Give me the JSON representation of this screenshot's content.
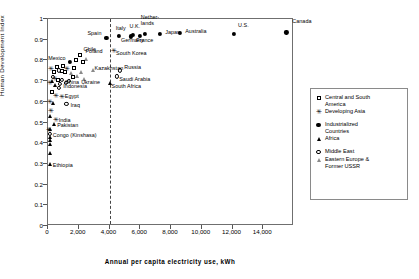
{
  "chart_data": {
    "type": "scatter",
    "title": "",
    "xlabel": "Annual per capita electricity use, kWh",
    "ylabel": "Human Development Index",
    "xlim": [
      0,
      16000
    ],
    "ylim": [
      0,
      1
    ],
    "xticks": [
      "0",
      "2,000",
      "4,000",
      "6,000",
      "8,000",
      "10,000",
      "12,000",
      "14,000"
    ],
    "xtick_values": [
      0,
      2000,
      4000,
      6000,
      8000,
      10000,
      12000,
      14000
    ],
    "yticks": [
      "0",
      "0.1",
      "0.2",
      "0.3",
      "0.4",
      "0.5",
      "0.6",
      "0.7",
      "0.8",
      "0.9",
      "1"
    ],
    "ytick_values": [
      0,
      0.1,
      0.2,
      0.3,
      0.4,
      0.5,
      0.6,
      0.7,
      0.8,
      0.9,
      1
    ],
    "grid": false,
    "threshold_line_x": 4000,
    "legend_position": "right",
    "legend": [
      {
        "label": "Central and South\nAmerica",
        "marker": "open-square"
      },
      {
        "label": "Developing Asia",
        "marker": "plus"
      },
      {
        "label": "Industrialized\nCountries",
        "marker": "filled-circle"
      },
      {
        "label": "Africa",
        "marker": "filled-triangle"
      },
      {
        "label": "Middle East",
        "marker": "open-circle"
      },
      {
        "label": "Eastern Europe &\nFormer USSR",
        "marker": "open-triangle"
      }
    ],
    "points": [
      {
        "name": "Canada",
        "x": 15500,
        "y": 0.935,
        "marker": "filled-circle",
        "label": "Canada",
        "lx": 6,
        "ly": -11
      },
      {
        "name": "U.S.",
        "x": 12100,
        "y": 0.928,
        "marker": "filled-circle",
        "label": "U.S.",
        "lx": 4,
        "ly": -9
      },
      {
        "name": "Australia",
        "x": 8600,
        "y": 0.932,
        "marker": "filled-circle",
        "label": "Australia",
        "lx": 5,
        "ly": -2
      },
      {
        "name": "Japan",
        "x": 7300,
        "y": 0.929,
        "marker": "filled-circle",
        "label": "Japan",
        "lx": 5,
        "ly": -2
      },
      {
        "name": "Netherlands",
        "x": 6300,
        "y": 0.927,
        "marker": "filled-circle",
        "label": "Nether-\nlands",
        "lx": -4,
        "ly": -17
      },
      {
        "name": "France",
        "x": 6000,
        "y": 0.918,
        "marker": "filled-circle",
        "label": "France",
        "lx": -4,
        "ly": 4
      },
      {
        "name": "U.K.",
        "x": 5500,
        "y": 0.923,
        "marker": "filled-circle",
        "label": "U.K.",
        "lx": -3,
        "ly": -9
      },
      {
        "name": "Germany",
        "x": 5400,
        "y": 0.916,
        "marker": "filled-circle",
        "label": "Germany",
        "lx": -10,
        "ly": 4
      },
      {
        "name": "Italy",
        "x": 4600,
        "y": 0.918,
        "marker": "filled-circle",
        "label": "Italy",
        "lx": -3,
        "ly": -8
      },
      {
        "name": "Spain",
        "x": 3800,
        "y": 0.907,
        "marker": "filled-circle",
        "label": "Spain",
        "lx": -19,
        "ly": -5
      },
      {
        "name": "South Korea",
        "x": 4300,
        "y": 0.845,
        "marker": "plus",
        "label": "South Korea",
        "lx": 2,
        "ly": 2
      },
      {
        "name": "Chile",
        "x": 2050,
        "y": 0.828,
        "marker": "open-square",
        "label": "Chile",
        "lx": 4,
        "ly": -6
      },
      {
        "name": "Poland",
        "x": 2500,
        "y": 0.805,
        "marker": "open-triangle",
        "label": "Poland",
        "lx": -1,
        "ly": -8
      },
      {
        "name": "Mexico",
        "x": 1450,
        "y": 0.792,
        "marker": "filled-circle",
        "label": "Mexico",
        "lx": -22,
        "ly": -4
      },
      {
        "name": "Kazakhstan",
        "x": 2900,
        "y": 0.755,
        "marker": "open-triangle",
        "label": "Kazakhstan",
        "lx": 2,
        "ly": -2
      },
      {
        "name": "Russia",
        "x": 4700,
        "y": 0.752,
        "marker": "open-circle",
        "label": "Russia",
        "lx": 4,
        "ly": -3
      },
      {
        "name": "Saudi Arabia",
        "x": 4500,
        "y": 0.723,
        "marker": "open-circle",
        "label": "Saudi Arabia",
        "lx": 2,
        "ly": 3
      },
      {
        "name": "Ukraine",
        "x": 2350,
        "y": 0.712,
        "marker": "open-triangle",
        "label": "Ukraine",
        "lx": -3,
        "ly": 3
      },
      {
        "name": "South Africa",
        "x": 4000,
        "y": 0.693,
        "marker": "filled-triangle",
        "label": "South Africa",
        "lx": 2,
        "ly": 3
      },
      {
        "name": "China",
        "x": 900,
        "y": 0.706,
        "marker": "open-circle",
        "label": "China",
        "lx": 3,
        "ly": 2
      },
      {
        "name": "Indonesia",
        "x": 800,
        "y": 0.688,
        "marker": "open-circle",
        "label": "Indonesia",
        "lx": 3,
        "ly": 2
      },
      {
        "name": "Egypt",
        "x": 900,
        "y": 0.622,
        "marker": "plus",
        "label": "Egypt",
        "lx": 3,
        "ly": -1
      },
      {
        "name": "Iraq",
        "x": 1200,
        "y": 0.588,
        "marker": "open-circle",
        "label": "Iraq",
        "lx": 4,
        "ly": 1
      },
      {
        "name": "India",
        "x": 500,
        "y": 0.512,
        "marker": "plus",
        "label": "India",
        "lx": 3,
        "ly": 0
      },
      {
        "name": "Pakistan",
        "x": 400,
        "y": 0.492,
        "marker": "filled-triangle",
        "label": "Pakistan",
        "lx": 3,
        "ly": 1
      },
      {
        "name": "Congo (Kinshasa)",
        "x": 110,
        "y": 0.445,
        "marker": "open-circle",
        "label": "Congo (Kinshasa)",
        "lx": 3,
        "ly": 1
      },
      {
        "name": "Ethiopia",
        "x": 120,
        "y": 0.3,
        "marker": "filled-triangle",
        "label": "Ethiopia",
        "lx": 3,
        "ly": 1
      },
      {
        "name": "p01",
        "x": 200,
        "y": 0.76,
        "marker": "plus",
        "label": "",
        "lx": 0,
        "ly": 0
      },
      {
        "name": "p02",
        "x": 380,
        "y": 0.745,
        "marker": "open-square",
        "label": "",
        "lx": 0,
        "ly": 0
      },
      {
        "name": "p03",
        "x": 560,
        "y": 0.77,
        "marker": "open-square",
        "label": "",
        "lx": 0,
        "ly": 0
      },
      {
        "name": "p04",
        "x": 700,
        "y": 0.752,
        "marker": "open-circle",
        "label": "",
        "lx": 0,
        "ly": 0
      },
      {
        "name": "p05",
        "x": 900,
        "y": 0.748,
        "marker": "open-square",
        "label": "",
        "lx": 0,
        "ly": 0
      },
      {
        "name": "p06",
        "x": 1100,
        "y": 0.742,
        "marker": "open-square",
        "label": "",
        "lx": 0,
        "ly": 0
      },
      {
        "name": "p07",
        "x": 1250,
        "y": 0.76,
        "marker": "plus",
        "label": "",
        "lx": 0,
        "ly": 0
      },
      {
        "name": "p08",
        "x": 1500,
        "y": 0.74,
        "marker": "open-triangle",
        "label": "",
        "lx": 0,
        "ly": 0
      },
      {
        "name": "p09",
        "x": 1700,
        "y": 0.762,
        "marker": "open-square",
        "label": "",
        "lx": 0,
        "ly": 0
      },
      {
        "name": "p10",
        "x": 1850,
        "y": 0.8,
        "marker": "open-square",
        "label": "",
        "lx": 0,
        "ly": 0
      },
      {
        "name": "p11",
        "x": 1600,
        "y": 0.718,
        "marker": "open-square",
        "label": "",
        "lx": 0,
        "ly": 0
      },
      {
        "name": "p12",
        "x": 1900,
        "y": 0.725,
        "marker": "open-triangle",
        "label": "",
        "lx": 0,
        "ly": 0
      },
      {
        "name": "p13",
        "x": 2150,
        "y": 0.742,
        "marker": "open-triangle",
        "label": "",
        "lx": 0,
        "ly": 0
      },
      {
        "name": "p14",
        "x": 300,
        "y": 0.72,
        "marker": "open-circle",
        "label": "",
        "lx": 0,
        "ly": 0
      },
      {
        "name": "p15",
        "x": 450,
        "y": 0.712,
        "marker": "plus",
        "label": "",
        "lx": 0,
        "ly": 0
      },
      {
        "name": "p16",
        "x": 620,
        "y": 0.705,
        "marker": "open-square",
        "label": "",
        "lx": 0,
        "ly": 0
      },
      {
        "name": "p17",
        "x": 250,
        "y": 0.7,
        "marker": "filled-triangle",
        "label": "",
        "lx": 0,
        "ly": 0
      },
      {
        "name": "p18",
        "x": 150,
        "y": 0.69,
        "marker": "plus",
        "label": "",
        "lx": 0,
        "ly": 0
      },
      {
        "name": "p19",
        "x": 430,
        "y": 0.68,
        "marker": "filled-triangle",
        "label": "",
        "lx": 0,
        "ly": 0
      },
      {
        "name": "p20",
        "x": 700,
        "y": 0.668,
        "marker": "open-circle",
        "label": "",
        "lx": 0,
        "ly": 0
      },
      {
        "name": "p21",
        "x": 280,
        "y": 0.645,
        "marker": "open-square",
        "label": "",
        "lx": 0,
        "ly": 0
      },
      {
        "name": "p22",
        "x": 520,
        "y": 0.63,
        "marker": "plus",
        "label": "",
        "lx": 0,
        "ly": 0
      },
      {
        "name": "p23",
        "x": 120,
        "y": 0.6,
        "marker": "plus",
        "label": "",
        "lx": 0,
        "ly": 0
      },
      {
        "name": "p24",
        "x": 330,
        "y": 0.592,
        "marker": "filled-triangle",
        "label": "",
        "lx": 0,
        "ly": 0
      },
      {
        "name": "p25",
        "x": 180,
        "y": 0.556,
        "marker": "plus",
        "label": "",
        "lx": 0,
        "ly": 0
      },
      {
        "name": "p26",
        "x": 150,
        "y": 0.533,
        "marker": "filled-triangle",
        "label": "",
        "lx": 0,
        "ly": 0
      },
      {
        "name": "p27",
        "x": 120,
        "y": 0.47,
        "marker": "filled-triangle",
        "label": "",
        "lx": 0,
        "ly": 0
      },
      {
        "name": "p28",
        "x": 110,
        "y": 0.43,
        "marker": "filled-triangle",
        "label": "",
        "lx": 0,
        "ly": 0
      },
      {
        "name": "p29",
        "x": 100,
        "y": 0.415,
        "marker": "filled-triangle",
        "label": "",
        "lx": 0,
        "ly": 0
      },
      {
        "name": "p30",
        "x": 105,
        "y": 0.398,
        "marker": "filled-triangle",
        "label": "",
        "lx": 0,
        "ly": 0
      },
      {
        "name": "p31",
        "x": 115,
        "y": 0.352,
        "marker": "filled-triangle",
        "label": "",
        "lx": 0,
        "ly": 0
      },
      {
        "name": "p32",
        "x": 95,
        "y": 0.465,
        "marker": "plus",
        "label": "",
        "lx": 0,
        "ly": 0
      },
      {
        "name": "p33",
        "x": 1000,
        "y": 0.775,
        "marker": "open-square",
        "label": "",
        "lx": 0,
        "ly": 0
      },
      {
        "name": "p34",
        "x": 2250,
        "y": 0.79,
        "marker": "open-square",
        "label": "",
        "lx": 0,
        "ly": 0
      },
      {
        "name": "p35",
        "x": 1350,
        "y": 0.7,
        "marker": "open-circle",
        "label": "",
        "lx": 0,
        "ly": 0
      },
      {
        "name": "p36",
        "x": 1150,
        "y": 0.69,
        "marker": "open-circle",
        "label": "",
        "lx": 0,
        "ly": 0
      }
    ]
  }
}
